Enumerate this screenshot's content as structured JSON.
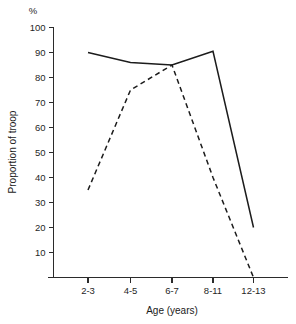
{
  "chart_data": {
    "type": "line",
    "title": "",
    "xlabel": "Age (years)",
    "ylabel": "Proportion of troop",
    "unit_label": "%",
    "categories": [
      "2-3",
      "4-5",
      "6-7",
      "8-11",
      "12-13"
    ],
    "ylim": [
      0,
      100
    ],
    "yticks": [
      10,
      20,
      30,
      40,
      50,
      60,
      70,
      80,
      90,
      100
    ],
    "grid": false,
    "legend": "none",
    "series": [
      {
        "name": "solid-series",
        "style": "solid",
        "color": "#1c1c1c",
        "values": [
          90,
          86,
          85,
          90.5,
          20
        ]
      },
      {
        "name": "dashed-series",
        "style": "dashed",
        "color": "#1c1c1c",
        "values": [
          35,
          75,
          85,
          40,
          0
        ]
      }
    ]
  },
  "axis": {
    "y_tick_labels": [
      "100",
      "90",
      "80",
      "70",
      "60",
      "50",
      "40",
      "30",
      "20",
      "10"
    ],
    "x_tick_labels": [
      "2-3",
      "4-5",
      "6-7",
      "8-11",
      "12-13"
    ],
    "x_title": "Age (years)",
    "y_title": "Proportion of troop",
    "percent_symbol": "%"
  }
}
